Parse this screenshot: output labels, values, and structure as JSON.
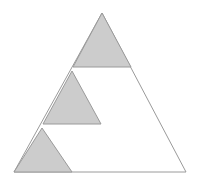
{
  "figure": {
    "canvas": {
      "width": 201,
      "height": 188
    },
    "background_color": "#ffffff",
    "stroke_color": "#9a9a9a",
    "fill_color": "#cccccc",
    "unfilled_color": "#ffffff",
    "stroke_width": 1,
    "shapes": [
      {
        "name": "large-outline-triangle",
        "role": "outer boundary",
        "filled": false,
        "fill": "#ffffff",
        "stroke": "#9a9a9a",
        "points": "102,13 186,172 14,172",
        "vertices": [
          {
            "label": "apex",
            "x": 102,
            "y": 13
          },
          {
            "label": "bottom-right",
            "x": 186,
            "y": 172
          },
          {
            "label": "bottom-left",
            "x": 14,
            "y": 172
          }
        ]
      },
      {
        "name": "top-shaded-triangle",
        "role": "upper sub-triangle at apex",
        "filled": true,
        "fill": "#cccccc",
        "stroke": "#9a9a9a",
        "points": "102,13 131,67 73,67",
        "vertices": [
          {
            "label": "apex",
            "x": 102,
            "y": 13
          },
          {
            "label": "base-right",
            "x": 131,
            "y": 67
          },
          {
            "label": "base-left",
            "x": 73,
            "y": 67
          }
        ]
      },
      {
        "name": "middle-shaded-triangle",
        "role": "middle sub-triangle",
        "filled": true,
        "fill": "#cccccc",
        "stroke": "#9a9a9a",
        "points": "72,71 101,124 43,124",
        "vertices": [
          {
            "label": "apex",
            "x": 72,
            "y": 71
          },
          {
            "label": "base-right",
            "x": 101,
            "y": 124
          },
          {
            "label": "base-left",
            "x": 43,
            "y": 124
          }
        ]
      },
      {
        "name": "bottom-shaded-triangle",
        "role": "lower-left sub-triangle",
        "filled": true,
        "fill": "#cccccc",
        "stroke": "#9a9a9a",
        "points": "42,128 72,172 14,172",
        "vertices": [
          {
            "label": "apex",
            "x": 42,
            "y": 128
          },
          {
            "label": "base-right",
            "x": 72,
            "y": 172
          },
          {
            "label": "base-left",
            "x": 14,
            "y": 172
          }
        ]
      }
    ]
  }
}
